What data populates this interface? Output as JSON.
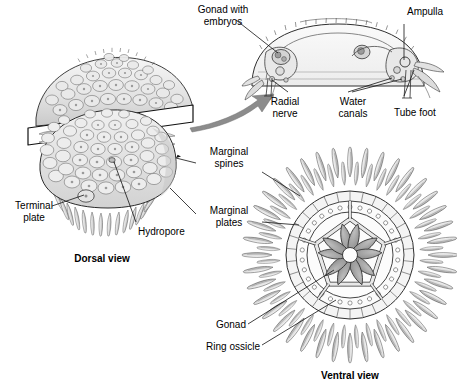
{
  "figure": {
    "background_color": "#ffffff",
    "line_color": "#1a1a1a",
    "fill_light": "#f2f2f2",
    "fill_mid": "#d9d9d9",
    "fill_dark": "#a8a8a8",
    "arrow_color": "#8c8c8c"
  },
  "labels": {
    "gonad_with_embryos": "Gonad with\nembryos",
    "ampulla": "Ampulla",
    "radial_nerve": "Radial\nnerve",
    "water_canals": "Water\ncanals",
    "tube_foot": "Tube foot",
    "marginal_spines": "Marginal\nspines",
    "marginal_plates": "Marginal\nplates",
    "terminal_plate": "Terminal\nplate",
    "hydropore": "Hydropore",
    "gonad": "Gonad",
    "ring_ossicle": "Ring ossicle",
    "dorsal_view": "Dorsal view",
    "ventral_view": "Ventral view"
  },
  "views": {
    "dorsal": {
      "caption": "Dorsal view",
      "features": [
        "test plates",
        "marginal spines",
        "terminal plate",
        "hydropore",
        "cutting plane"
      ]
    },
    "cross_section": {
      "features": [
        "gonad with embryos",
        "ampulla",
        "radial nerve",
        "water canals",
        "tube foot"
      ]
    },
    "ventral": {
      "caption": "Ventral view",
      "features": [
        "ring ossicle",
        "gonad",
        "marginal plates",
        "marginal spines"
      ],
      "symmetry": 5,
      "gonad_count": 10
    }
  }
}
